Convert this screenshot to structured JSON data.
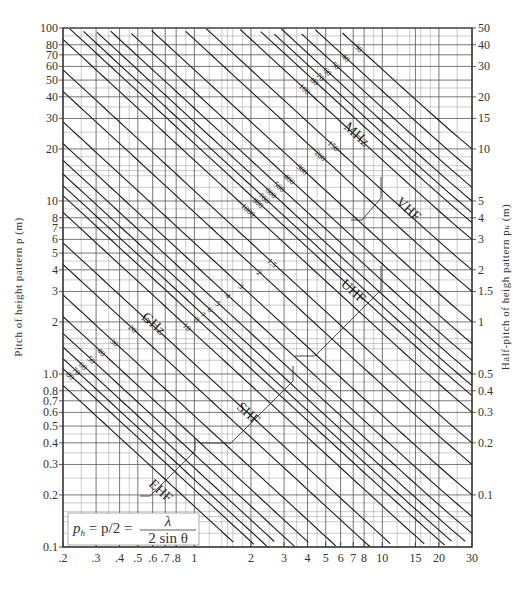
{
  "chart_data": {
    "type": "line",
    "title": "",
    "scale": "log-log",
    "xlabel": "",
    "ylabel": "Pitch of height pattern p (m)",
    "ylabel_right": "Half-pitch of heigh pattern p_h (m)",
    "xlim": [
      0.2,
      30
    ],
    "ylim": [
      0.1,
      100
    ],
    "ylim_right": [
      0.05,
      50
    ],
    "grid": true,
    "x_ticks": [
      {
        "value": 0.2,
        "label": ".2"
      },
      {
        "value": 0.3,
        "label": ".3"
      },
      {
        "value": 0.4,
        "label": ".4"
      },
      {
        "value": 0.5,
        "label": ".5"
      },
      {
        "value": 0.6,
        "label": ".6"
      },
      {
        "value": 0.7,
        "label": ".7"
      },
      {
        "value": 0.8,
        "label": ".8"
      },
      {
        "value": 1,
        "label": "1"
      },
      {
        "value": 2,
        "label": "2"
      },
      {
        "value": 3,
        "label": "3"
      },
      {
        "value": 4,
        "label": "4"
      },
      {
        "value": 5,
        "label": "5"
      },
      {
        "value": 6,
        "label": "6"
      },
      {
        "value": 7,
        "label": "7"
      },
      {
        "value": 8,
        "label": "8"
      },
      {
        "value": 10,
        "label": "10"
      },
      {
        "value": 15,
        "label": "15"
      },
      {
        "value": 20,
        "label": "20"
      },
      {
        "value": 30,
        "label": "30"
      }
    ],
    "y_ticks_left": [
      {
        "value": 100,
        "label": "100"
      },
      {
        "value": 80,
        "label": "80"
      },
      {
        "value": 70,
        "label": "70"
      },
      {
        "value": 60,
        "label": "60"
      },
      {
        "value": 50,
        "label": "50"
      },
      {
        "value": 40,
        "label": "40"
      },
      {
        "value": 30,
        "label": "30"
      },
      {
        "value": 20,
        "label": "20"
      },
      {
        "value": 10,
        "label": "10"
      },
      {
        "value": 8,
        "label": "8"
      },
      {
        "value": 7,
        "label": "7"
      },
      {
        "value": 6,
        "label": "6"
      },
      {
        "value": 5,
        "label": "5"
      },
      {
        "value": 4,
        "label": "4"
      },
      {
        "value": 3,
        "label": "3"
      },
      {
        "value": 2,
        "label": "2"
      },
      {
        "value": 1.0,
        "label": "1.0"
      },
      {
        "value": 0.8,
        "label": "0.8"
      },
      {
        "value": 0.7,
        "label": "0.7"
      },
      {
        "value": 0.6,
        "label": "0.6"
      },
      {
        "value": 0.5,
        "label": "0.5"
      },
      {
        "value": 0.4,
        "label": "0.4"
      },
      {
        "value": 0.3,
        "label": "0.3"
      },
      {
        "value": 0.2,
        "label": "0.2"
      },
      {
        "value": 0.1,
        "label": "0.1"
      }
    ],
    "y_ticks_right": [
      {
        "value": 50,
        "label": "50"
      },
      {
        "value": 40,
        "label": "40"
      },
      {
        "value": 30,
        "label": "30"
      },
      {
        "value": 20,
        "label": "20"
      },
      {
        "value": 15,
        "label": "15"
      },
      {
        "value": 10,
        "label": "10"
      },
      {
        "value": 5,
        "label": "5"
      },
      {
        "value": 4,
        "label": "4"
      },
      {
        "value": 3,
        "label": "3"
      },
      {
        "value": 2,
        "label": "2"
      },
      {
        "value": 1.5,
        "label": "1.5"
      },
      {
        "value": 1,
        "label": "1"
      },
      {
        "value": 0.5,
        "label": "0.5"
      },
      {
        "value": 0.4,
        "label": "0.4"
      },
      {
        "value": 0.3,
        "label": "0.3"
      },
      {
        "value": 0.2,
        "label": "0.2"
      },
      {
        "value": 0.1,
        "label": "0.1"
      }
    ],
    "series_formula": "p = lambda / sin(theta), lambda = 300 / f[MHz] (m)",
    "series": [
      {
        "name": "30 MHz",
        "f_mhz": 30,
        "label": "30"
      },
      {
        "name": "40 MHz",
        "f_mhz": 40,
        "label": "40"
      },
      {
        "name": "50 MHz",
        "f_mhz": 50,
        "label": "50"
      },
      {
        "name": "60 MHz",
        "f_mhz": 60,
        "label": "60"
      },
      {
        "name": "70 MHz",
        "f_mhz": 70,
        "label": "70"
      },
      {
        "name": "80 MHz",
        "f_mhz": 80,
        "label": "80"
      },
      {
        "name": "100 MHz",
        "f_mhz": 100,
        "label": "100"
      },
      {
        "name": "150 MHz",
        "f_mhz": 150,
        "label": "150"
      },
      {
        "name": "200 MHz",
        "f_mhz": 200,
        "label": "200"
      },
      {
        "name": "300 MHz",
        "f_mhz": 300,
        "label": "300"
      },
      {
        "name": "400 MHz",
        "f_mhz": 400,
        "label": "400"
      },
      {
        "name": "500 MHz",
        "f_mhz": 500,
        "label": "500"
      },
      {
        "name": "600 MHz",
        "f_mhz": 600,
        "label": "600"
      },
      {
        "name": "700 MHz",
        "f_mhz": 700,
        "label": "700"
      },
      {
        "name": "800 MHz",
        "f_mhz": 800,
        "label": "800"
      },
      {
        "name": "1000 MHz / 1 GHz",
        "f_mhz": 1000,
        "label": "1000"
      },
      {
        "name": "1.5 GHz",
        "f_mhz": 1500,
        "label": "1.5"
      },
      {
        "name": "2 GHz",
        "f_mhz": 2000,
        "label": "2"
      },
      {
        "name": "3 GHz",
        "f_mhz": 3000,
        "label": "3"
      },
      {
        "name": "4 GHz",
        "f_mhz": 4000,
        "label": "4"
      },
      {
        "name": "5 GHz",
        "f_mhz": 5000,
        "label": "5"
      },
      {
        "name": "6 GHz",
        "f_mhz": 6000,
        "label": "6"
      },
      {
        "name": "7 GHz",
        "f_mhz": 7000,
        "label": "7"
      },
      {
        "name": "8 GHz",
        "f_mhz": 8000,
        "label": "8"
      },
      {
        "name": "10 GHz",
        "f_mhz": 10000,
        "label": "10"
      },
      {
        "name": "15 GHz",
        "f_mhz": 15000,
        "label": "15"
      },
      {
        "name": "20 GHz",
        "f_mhz": 20000,
        "label": "20"
      },
      {
        "name": "30 GHz",
        "f_mhz": 30000,
        "label": "30"
      },
      {
        "name": "40 GHz",
        "f_mhz": 40000,
        "label": "40"
      },
      {
        "name": "50 GHz",
        "f_mhz": 50000,
        "label": "50"
      },
      {
        "name": "60 GHz",
        "f_mhz": 60000,
        "label": "60"
      },
      {
        "name": "70 GHz",
        "f_mhz": 70000,
        "label": "70"
      },
      {
        "name": "80 GHz",
        "f_mhz": 80000,
        "label": "80"
      },
      {
        "name": "100 GHz",
        "f_mhz": 100000,
        "label": "100"
      }
    ],
    "annotations": {
      "unit_mhz": "MHz",
      "unit_ghz": "GHz",
      "bands": [
        {
          "name": "VHF",
          "f_range_mhz": [
            30,
            300
          ]
        },
        {
          "name": "UHF",
          "f_range_mhz": [
            300,
            3000
          ]
        },
        {
          "name": "SHF",
          "f_range_mhz": [
            3000,
            30000
          ]
        },
        {
          "name": "EHF",
          "f_range_mhz": [
            30000,
            100000
          ]
        }
      ],
      "formula": {
        "lhs": "p",
        "lhs_sub": "h",
        "middle": " = p/2 = ",
        "numerator": "λ",
        "denominator": "2 sin θ"
      }
    }
  }
}
